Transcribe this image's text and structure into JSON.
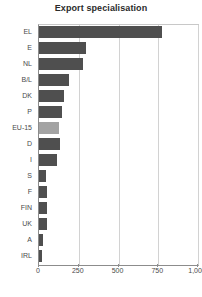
{
  "chart_data": {
    "type": "bar",
    "orientation": "horizontal",
    "title": "Export specialisation",
    "xlabel": "",
    "ylabel": "",
    "categories": [
      "EL",
      "E",
      "NL",
      "B/L",
      "DK",
      "P",
      "EU-15",
      "D",
      "I",
      "S",
      "F",
      "FIN",
      "UK",
      "A",
      "IRL"
    ],
    "values": [
      775,
      295,
      277,
      190,
      160,
      145,
      125,
      135,
      115,
      45,
      50,
      48,
      52,
      25,
      22
    ],
    "xlim": [
      0,
      1000
    ],
    "xticks": [
      0,
      250,
      500,
      750,
      1000
    ],
    "xtick_labels": [
      "0",
      "250",
      "500",
      "750",
      "1,000"
    ],
    "grid": true,
    "legend": false,
    "highlight_category": "EU-15",
    "colors": {
      "bar": "#4f4f4f",
      "highlight_bar": "#a3a3a3",
      "gridline": "#d2d2d2",
      "axis": "#8c8c8c",
      "text": "#4a4a4a",
      "title": "#2b2b2b",
      "background": "#ffffff"
    }
  }
}
